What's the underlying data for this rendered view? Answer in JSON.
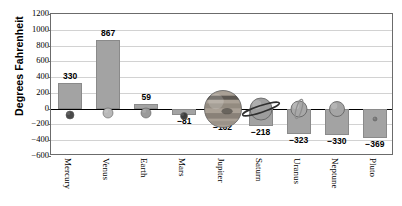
{
  "chart_data": {
    "type": "bar",
    "title": "",
    "xlabel": "",
    "ylabel": "Degrees Fahrenheit",
    "categories": [
      "Mercury",
      "Venus",
      "Earth",
      "Mars",
      "Jupiter",
      "Saturn",
      "Uranus",
      "Neptune",
      "Pluto"
    ],
    "values": [
      330,
      867,
      59,
      -81,
      -162,
      -218,
      -323,
      -330,
      -369
    ],
    "value_labels": [
      "330",
      "867",
      "59",
      "−81",
      "−162",
      "−218",
      "−323",
      "−330",
      "−369"
    ],
    "ylim": [
      -600,
      1200
    ],
    "ytick_values": [
      1200,
      1000,
      800,
      600,
      400,
      200,
      0,
      -200,
      -400,
      -600
    ],
    "ytick_labels": [
      "1200",
      "1000",
      "800",
      "600",
      "400",
      "200",
      "0",
      "−200",
      "−400",
      "−600"
    ],
    "grid": true,
    "legend": "none",
    "bar_color": "#a3a3a3",
    "bar_edge_color": "#8a8a8a",
    "axis_color": "#6b6b6b",
    "gridline_color": "#d2d2d2",
    "zero_line_color": "#000000",
    "markers": [
      {
        "name": "Mercury",
        "icon": "planet-mercury-icon",
        "size": 8,
        "color": "#4a4a4a"
      },
      {
        "name": "Venus",
        "icon": "planet-venus-icon",
        "size": 10,
        "color": "#b9b9b9"
      },
      {
        "name": "Earth",
        "icon": "planet-earth-icon",
        "size": 10,
        "color": "#9a9a9a"
      },
      {
        "name": "Mars",
        "icon": "planet-mars-icon",
        "size": 7,
        "color": "#3d3d3d"
      },
      {
        "name": "Jupiter",
        "icon": "planet-jupiter-icon",
        "size": 37,
        "color": "#a9a095"
      },
      {
        "name": "Saturn",
        "icon": "planet-saturn-icon",
        "size": 22,
        "color": "#9d9d9d"
      },
      {
        "name": "Uranus",
        "icon": "planet-uranus-icon",
        "size": 16,
        "color": "#a8a8a8"
      },
      {
        "name": "Neptune",
        "icon": "planet-neptune-icon",
        "size": 15,
        "color": "#a5a5a5"
      },
      {
        "name": "Pluto",
        "icon": "planet-pluto-icon",
        "size": 4,
        "color": "#7a7a7a"
      }
    ]
  }
}
